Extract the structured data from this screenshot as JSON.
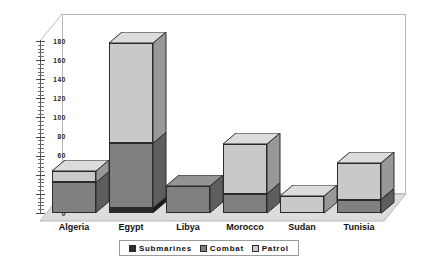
{
  "chart_data": {
    "type": "bar",
    "subtype": "stacked-3d-column",
    "title": "",
    "subtitle": "",
    "xlabel": "",
    "ylabel": "",
    "categories": [
      "Algeria",
      "Egypt",
      "Libya",
      "Morocco",
      "Sudan",
      "Tunisia"
    ],
    "series": [
      {
        "name": "Submarines",
        "color": "#2b2b2b",
        "values": [
          0,
          5,
          0,
          0,
          0,
          0
        ]
      },
      {
        "name": "Combat",
        "color": "#808080",
        "values": [
          32,
          68,
          28,
          20,
          0,
          14
        ]
      },
      {
        "name": "Patrol",
        "color": "#c9c9c9",
        "values": [
          12,
          105,
          0,
          52,
          18,
          38
        ]
      }
    ],
    "totals": [
      44,
      178,
      28,
      72,
      18,
      52
    ],
    "ylim": [
      0,
      180
    ],
    "ytick_step": 20,
    "ytick_labels": [
      "0",
      "20",
      "40",
      "60",
      "80",
      "100",
      "120",
      "140",
      "160",
      "180"
    ],
    "minor_ticks_per_interval": 4,
    "grid": false,
    "legend_position": "bottom",
    "background": "#ffffff",
    "plot_area_border": "#b9b9b9"
  },
  "axis": {
    "y_ticks": [
      {
        "value": 180,
        "label": "180"
      },
      {
        "value": 160,
        "label": "160"
      },
      {
        "value": 140,
        "label": "140"
      },
      {
        "value": 120,
        "label": "120"
      },
      {
        "value": 100,
        "label": "100"
      },
      {
        "value": 80,
        "label": "80"
      },
      {
        "value": 60,
        "label": "60"
      },
      {
        "value": 40,
        "label": "40"
      },
      {
        "value": 20,
        "label": "20"
      },
      {
        "value": 0,
        "label": "0"
      }
    ]
  },
  "legend": {
    "items": [
      {
        "label": "Submarines",
        "color": "#2b2b2b"
      },
      {
        "label": "Combat",
        "color": "#808080"
      },
      {
        "label": "Patrol",
        "color": "#c9c9c9"
      }
    ]
  },
  "colors": {
    "submarines": "#2b2b2b",
    "combat": "#808080",
    "patrol": "#c9c9c9",
    "submarines_side": "#1a1a1a",
    "combat_side": "#5e5e5e",
    "patrol_side": "#989898",
    "submarines_top": "#3d3d3d",
    "combat_top": "#949494",
    "patrol_top": "#dcdcdc",
    "floor": "#dcdcdc",
    "wall_line": "#b9b9b9",
    "axis": "#5a5a5a",
    "text": "#111111"
  }
}
